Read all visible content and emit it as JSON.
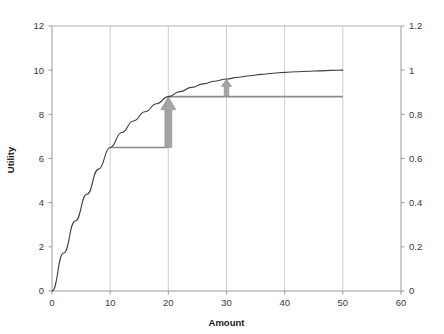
{
  "chart_data": {
    "type": "line",
    "title": "",
    "xlabel": "Amount",
    "ylabel": "Utility",
    "y2label": "",
    "xlim": [
      0,
      60
    ],
    "ylim": [
      0,
      12
    ],
    "y2lim": [
      0,
      1.2
    ],
    "grid": "vertical",
    "legend": "none",
    "xticks": [
      0,
      10,
      20,
      30,
      40,
      50,
      60
    ],
    "xtick_labels": [
      "0",
      "10",
      "20",
      "30",
      "40",
      "50",
      "60"
    ],
    "yticks": [
      0,
      2,
      4,
      6,
      8,
      10,
      12
    ],
    "ytick_labels": [
      "0",
      "2",
      "4",
      "6",
      "8",
      "10",
      "12"
    ],
    "y2ticks": [
      0,
      0.2,
      0.4,
      0.6,
      0.8,
      1.0,
      1.2
    ],
    "y2tick_labels": [
      "0",
      "0.2",
      "0.4",
      "0.6",
      "0.8",
      "1",
      "1.2"
    ],
    "series": [
      {
        "name": "Utility curve",
        "color": "#3d3d3d",
        "x": [
          0,
          2,
          4,
          6,
          8,
          10,
          12,
          14,
          16,
          18,
          20,
          22,
          24,
          26,
          28,
          30,
          32,
          34,
          36,
          38,
          40,
          42,
          44,
          46,
          48,
          50
        ],
        "values": [
          0,
          1.72,
          3.17,
          4.38,
          5.52,
          6.5,
          7.18,
          7.7,
          8.12,
          8.48,
          8.8,
          9.03,
          9.22,
          9.38,
          9.5,
          9.6,
          9.68,
          9.75,
          9.81,
          9.86,
          9.9,
          9.93,
          9.95,
          9.97,
          9.99,
          10.0
        ]
      }
    ],
    "annotations": [
      {
        "name": "guide-line-10",
        "type": "hline",
        "x_start": 10,
        "x_end": 20,
        "y": 6.5,
        "color": "#8c8c8c"
      },
      {
        "name": "guide-line-20",
        "type": "hline",
        "x_start": 20,
        "x_end": 50,
        "y": 8.8,
        "color": "#8c8c8c"
      },
      {
        "name": "utility-gain-arrow-first",
        "type": "arrow",
        "x": 20,
        "y_start": 6.5,
        "y_end": 8.8,
        "color": "#a3a3a3",
        "direction": "up"
      },
      {
        "name": "utility-gain-arrow-second",
        "type": "arrow",
        "x": 30,
        "y_start": 8.8,
        "y_end": 9.6,
        "color": "#a3a3a3",
        "direction": "up"
      }
    ]
  }
}
